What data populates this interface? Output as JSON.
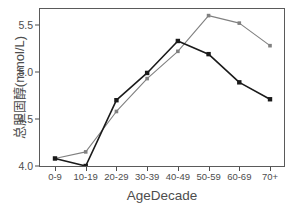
{
  "chart_data": {
    "type": "line",
    "title": "",
    "xlabel": "AgeDecade",
    "ylabel": "总胆固醇(mmol/L)",
    "categories": [
      "0-9",
      "10-19",
      "20-29",
      "30-39",
      "40-49",
      "50-59",
      "60-69",
      "70+"
    ],
    "ylim": [
      3.88,
      5.7
    ],
    "yticks": [
      4.0,
      4.5,
      5.0,
      5.5
    ],
    "ytick_labels": [
      "4.0",
      "4.5",
      "5.0",
      "5.5"
    ],
    "grid": false,
    "legend": "none",
    "series": [
      {
        "name": "series-dark",
        "color": "#1a1a1a",
        "marker": "square",
        "values": [
          4.08,
          4.0,
          4.7,
          4.99,
          5.33,
          5.19,
          4.89,
          4.71
        ]
      },
      {
        "name": "series-gray",
        "color": "#808080",
        "marker": "square",
        "values": [
          4.08,
          4.15,
          4.58,
          4.93,
          5.22,
          5.6,
          5.52,
          5.28
        ]
      }
    ]
  },
  "axis": {
    "x_title": "AgeDecade",
    "y_title": "总胆固醇(mmol/L)"
  }
}
